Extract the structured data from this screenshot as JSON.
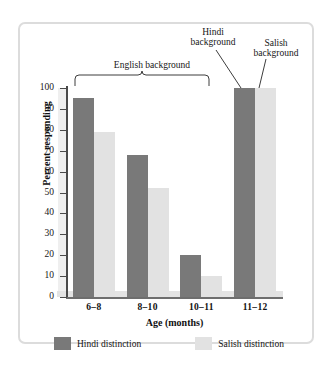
{
  "chart_data": {
    "type": "bar",
    "title": "",
    "xlabel": "Age (months)",
    "ylabel": "Percent responding",
    "categories": [
      "6–8",
      "8–10",
      "10–11",
      "11–12"
    ],
    "series": [
      {
        "name": "Hindi distinction",
        "color": "#797979",
        "values": [
          95,
          68,
          20,
          100
        ]
      },
      {
        "name": "Salish distinction",
        "color": "#e2e2e2",
        "values": [
          79,
          52,
          10,
          100
        ]
      }
    ],
    "ylim": [
      0,
      100
    ],
    "yticks": [
      0,
      10,
      20,
      30,
      40,
      50,
      60,
      70,
      80,
      90,
      100
    ],
    "ytick_labels": [
      "0",
      "10",
      "20",
      "30",
      "40",
      "50",
      "60",
      "70",
      "80",
      "90",
      "100"
    ],
    "grid": false,
    "legend_position": "bottom",
    "annotations": [
      {
        "name": "english-background",
        "text": "English background",
        "kind": "bracket",
        "covers": [
          "6–8",
          "8–10",
          "10–11"
        ]
      },
      {
        "name": "hindi-background",
        "text": "Hindi background",
        "kind": "pointer",
        "points_to": "11–12 Hindi distinction bar"
      },
      {
        "name": "salish-background",
        "text": "Salish background",
        "kind": "pointer",
        "points_to": "11–12 Salish distinction bar"
      }
    ]
  },
  "annotations": {
    "english": "English background",
    "hindi_line1": "Hindi",
    "hindi_line2": "background",
    "salish_line1": "Salish",
    "salish_line2": "background"
  },
  "axes": {
    "y_title": "Percent responding",
    "x_title": "Age (months)",
    "y_labels": [
      "100",
      "90",
      "80",
      "70",
      "60",
      "50",
      "40",
      "30",
      "20",
      "10",
      "0"
    ],
    "x_labels": [
      "6–8",
      "8–10",
      "10–11",
      "11–12"
    ]
  },
  "legend": {
    "items": [
      {
        "label": "Hindi distinction",
        "color": "#797979"
      },
      {
        "label": "Salish distinction",
        "color": "#e2e2e2"
      }
    ]
  },
  "colors": {
    "hindi_bar": "#797979",
    "salish_bar": "#e2e2e2",
    "axis": "#4a4a4a",
    "frame": "#dcdcdc",
    "background": "#ffffff"
  }
}
